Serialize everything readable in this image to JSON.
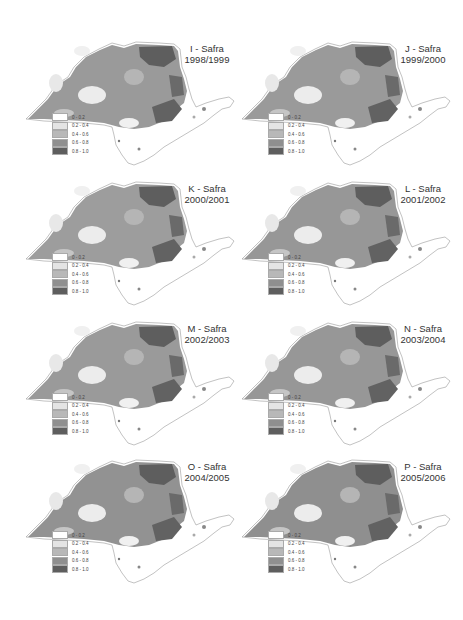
{
  "figure": {
    "legend": {
      "classes": [
        {
          "label": "0 - 0.2",
          "color": "#ffffff"
        },
        {
          "label": "0.2 - 0.4",
          "color": "#e4e4e4"
        },
        {
          "label": "0.4 - 0.6",
          "color": "#b8b8b8"
        },
        {
          "label": "0.6 - 0.8",
          "color": "#8f8f8f"
        },
        {
          "label": "0.8 - 1.0",
          "color": "#5e5e5e"
        }
      ]
    },
    "panels": [
      {
        "letter": "I",
        "title": "I - Safra",
        "season": "1998/1999"
      },
      {
        "letter": "J",
        "title": "J - Safra",
        "season": "1999/2000"
      },
      {
        "letter": "K",
        "title": "K - Safra",
        "season": "2000/2001"
      },
      {
        "letter": "L",
        "title": "L - Safra",
        "season": "2001/2002"
      },
      {
        "letter": "M",
        "title": "M - Safra",
        "season": "2002/2003"
      },
      {
        "letter": "N",
        "title": "N - Safra",
        "season": "2003/2004"
      },
      {
        "letter": "O",
        "title": "O - Safra",
        "season": "2004/2005"
      },
      {
        "letter": "P",
        "title": "P - Safra",
        "season": "2005/2006"
      }
    ]
  }
}
